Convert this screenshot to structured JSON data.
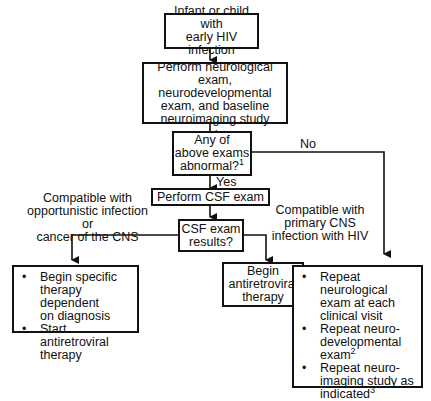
{
  "flowchart": {
    "start": {
      "lines": [
        "Infant or child with",
        "early HIV infection"
      ]
    },
    "exam": {
      "lines": [
        "Perform neurological exam,",
        "neurodevelopmental",
        "exam, and baseline",
        "neuroimaging study"
      ]
    },
    "decision": {
      "lines": [
        "Any of",
        "above exams",
        "abnormal?"
      ],
      "footnote": "1"
    },
    "no_label": "No",
    "yes_label": "Yes",
    "csf_exam": {
      "label": "Perform CSF exam"
    },
    "csf_results": {
      "lines": [
        "CSF exam",
        "results?"
      ]
    },
    "left_condition": {
      "lines": [
        "Compatible with",
        "opportunistic infection or",
        "cancer of the CNS"
      ]
    },
    "right_condition": {
      "lines": [
        "Compatible with",
        "primary CNS",
        "infection with HIV"
      ]
    },
    "left_outcome": {
      "items": [
        {
          "lines": [
            "Begin specific",
            "therapy dependent",
            "on diagnosis"
          ]
        },
        {
          "lines": [
            "Start antiretroviral",
            "therapy"
          ]
        }
      ]
    },
    "middle_outcome": {
      "lines": [
        "Begin",
        "antiretroviral",
        "therapy"
      ]
    },
    "right_outcome": {
      "items": [
        {
          "lines": [
            "Repeat neurological",
            "exam at each",
            "clinical visit"
          ],
          "footnote": ""
        },
        {
          "lines": [
            "Repeat neuro-",
            "developmental",
            "exam"
          ],
          "footnote": "2"
        },
        {
          "lines": [
            "Repeat neuro-",
            "imaging study as",
            "indicated"
          ],
          "footnote": "3"
        }
      ]
    }
  }
}
